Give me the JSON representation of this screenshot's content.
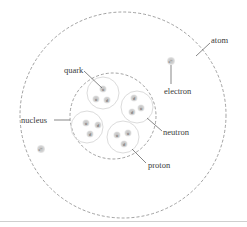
{
  "labels": {
    "atom": "atom",
    "electron": "electron",
    "quark": "quark",
    "nucleus": "nucleus",
    "neutron": "neutron",
    "proton": "proton"
  },
  "electron_symbol": "e⁻",
  "nucleons": [
    {
      "type": "proton",
      "quarks": [
        "u",
        "u",
        "d"
      ]
    },
    {
      "type": "neutron",
      "quarks": [
        "d",
        "d",
        "u"
      ]
    },
    {
      "type": "proton",
      "quarks": [
        "u",
        "d",
        "d"
      ]
    },
    {
      "type": "proton",
      "quarks": [
        "u",
        "u",
        "d"
      ]
    }
  ],
  "colors": {
    "dashed_outline": "#8a8a8a",
    "nucleon_outline": "#dcdcdc",
    "particle_fill": "#c8c8c8",
    "leader_line": "#555555",
    "text": "#3a3a3a"
  }
}
